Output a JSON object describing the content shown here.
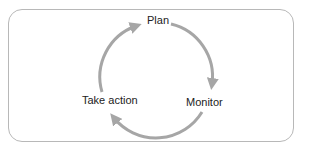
{
  "diagram": {
    "type": "cycle",
    "nodes": [
      {
        "id": "plan",
        "label": "Plan"
      },
      {
        "id": "monitor",
        "label": "Monitor"
      },
      {
        "id": "take_action",
        "label": "Take action"
      }
    ],
    "edges": [
      {
        "from": "plan",
        "to": "monitor"
      },
      {
        "from": "monitor",
        "to": "take_action"
      },
      {
        "from": "take_action",
        "to": "plan"
      }
    ],
    "colors": {
      "arrow": "#a6a6a6",
      "border": "#b8b8b8",
      "text": "#222222"
    }
  }
}
